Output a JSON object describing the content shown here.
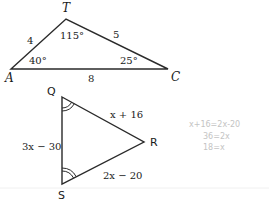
{
  "triangle_ATC": {
    "vertices": {
      "A": "A",
      "T": "T",
      "C": "C"
    },
    "sides": {
      "AT": "4",
      "TC": "5",
      "AC": "8"
    },
    "angles": {
      "A": "40°",
      "T": "115°",
      "C": "25°"
    }
  },
  "triangle_QRS": {
    "vertices": {
      "Q": "Q",
      "R": "R",
      "S": "S"
    },
    "sides": {
      "QR": "x + 16",
      "QS": "3x − 30",
      "SR": "2x − 20"
    },
    "congruent_angle_marks": [
      "Q",
      "S"
    ]
  },
  "handwritten_notes": [
    "x+16=2x-20",
    "36=2x",
    "18=x"
  ],
  "colors": {
    "line": "#2a2a2a",
    "handwriting": "#c4c4c4",
    "background": "#ffffff"
  }
}
